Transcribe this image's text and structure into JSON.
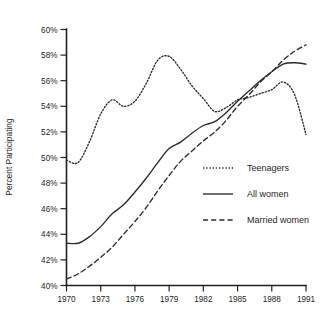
{
  "chart_data": {
    "type": "line",
    "title": "",
    "xlabel": "",
    "ylabel": "Percent Participating",
    "xlim": [
      1970,
      1991
    ],
    "ylim": [
      40,
      60
    ],
    "ytick_step": 2,
    "grid": false,
    "legend_position": "inside-right-middle",
    "x_ticks": [
      1970,
      1973,
      1976,
      1979,
      1982,
      1985,
      1988,
      1991
    ],
    "x_tick_labels": [
      "1970",
      "1973",
      "1976",
      "1979",
      "1982",
      "1985",
      "1988",
      "1991"
    ],
    "y_ticks": [
      40,
      42,
      44,
      46,
      48,
      50,
      52,
      54,
      56,
      58,
      60
    ],
    "y_tick_labels": [
      "40%",
      "42%",
      "44%",
      "46%",
      "48%",
      "50%",
      "52%",
      "54%",
      "56%",
      "58%",
      "60%"
    ],
    "x": [
      1970,
      1971,
      1972,
      1973,
      1974,
      1975,
      1976,
      1977,
      1978,
      1979,
      1980,
      1981,
      1982,
      1983,
      1984,
      1985,
      1986,
      1987,
      1988,
      1989,
      1990,
      1991
    ],
    "series": [
      {
        "name": "Teenagers",
        "style": "dotted",
        "values": [
          49.8,
          49.6,
          51.2,
          53.4,
          54.5,
          54.0,
          54.4,
          55.8,
          57.6,
          57.9,
          56.9,
          55.6,
          54.6,
          53.6,
          53.9,
          54.5,
          54.7,
          55.0,
          55.3,
          55.9,
          54.9,
          51.8
        ]
      },
      {
        "name": "All women",
        "style": "solid",
        "values": [
          43.3,
          43.3,
          43.8,
          44.6,
          45.6,
          46.3,
          47.3,
          48.4,
          49.6,
          50.7,
          51.2,
          51.9,
          52.5,
          52.8,
          53.5,
          54.4,
          55.2,
          56.0,
          56.7,
          57.3,
          57.4,
          57.3
        ]
      },
      {
        "name": "Married women",
        "style": "dashed",
        "values": [
          40.5,
          40.9,
          41.5,
          42.2,
          43.0,
          44.0,
          45.0,
          46.1,
          47.4,
          48.6,
          49.7,
          50.5,
          51.3,
          52.0,
          52.9,
          54.0,
          54.9,
          55.9,
          56.7,
          57.6,
          58.3,
          58.8
        ]
      }
    ],
    "legend": [
      {
        "label": "Teenagers",
        "style": "dotted"
      },
      {
        "label": "All women",
        "style": "solid"
      },
      {
        "label": "Married women",
        "style": "dashed"
      }
    ],
    "colors": {
      "axis": "#231f20",
      "line": "#2b2b2b",
      "background": "#ffffff"
    }
  }
}
